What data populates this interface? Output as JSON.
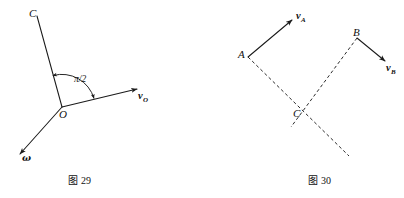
{
  "page": {
    "width": 404,
    "height": 198,
    "background": "#ffffff",
    "ink_color": "#111111"
  },
  "figures": [
    {
      "id": "figure-29",
      "caption_prefix": "图",
      "caption_number": "29",
      "caption_full": "图 29",
      "description": "Rod OC pivoting at O with velocity vector v_O and angular velocity vector omega, right angle pi/2 marked between OC and v_O",
      "points": [
        {
          "name": "C",
          "label": "C",
          "x": 37,
          "y": 16
        },
        {
          "name": "O",
          "label": "O",
          "x": 62,
          "y": 107
        }
      ],
      "vectors": [
        {
          "name": "v_O",
          "symbol": "v",
          "subscript": "O",
          "from_x": 62,
          "from_y": 107,
          "to_x": 140,
          "to_y": 88
        },
        {
          "name": "omega",
          "symbol": "ω",
          "subscript": "",
          "from_x": 62,
          "from_y": 107,
          "to_x": 17,
          "to_y": 157
        }
      ],
      "segments": [
        {
          "name": "rod-OC",
          "from_x": 62,
          "from_y": 107,
          "to_x": 37,
          "to_y": 16,
          "style": "solid"
        }
      ],
      "angle": {
        "name": "pi-over-2",
        "label": "π/2",
        "value": "π/2",
        "vertex_x": 62,
        "vertex_y": 107
      }
    },
    {
      "id": "figure-30",
      "caption_prefix": "图",
      "caption_number": "30",
      "caption_full": "图 30",
      "description": "Points A and B with velocity vectors v_A and v_B; dashed perpendicular construction lines meeting at instantaneous centre C",
      "points": [
        {
          "name": "A",
          "label": "A",
          "x": 248,
          "y": 57
        },
        {
          "name": "B",
          "label": "B",
          "x": 357,
          "y": 38
        },
        {
          "name": "C",
          "label": "C",
          "x": 305,
          "y": 112
        }
      ],
      "vectors": [
        {
          "name": "v_A",
          "symbol": "v",
          "subscript": "A",
          "from_x": 248,
          "from_y": 57,
          "to_x": 295,
          "to_y": 17
        },
        {
          "name": "v_B",
          "symbol": "v",
          "subscript": "B",
          "from_x": 357,
          "from_y": 38,
          "to_x": 388,
          "to_y": 63
        }
      ],
      "segments": [
        {
          "name": "construction-line-A",
          "from_x": 248,
          "from_y": 57,
          "to_x": 349,
          "to_y": 156,
          "style": "dashed"
        },
        {
          "name": "construction-line-B",
          "from_x": 357,
          "from_y": 38,
          "to_x": 291,
          "to_y": 127,
          "style": "dashed"
        }
      ]
    }
  ],
  "labels": {
    "fig29": {
      "C": "C",
      "O": "O",
      "angle": "π/2",
      "v_O_symbol": "v",
      "v_O_sub": "O",
      "omega": "ω"
    },
    "fig30": {
      "A": "A",
      "B": "B",
      "C": "C",
      "v_A_symbol": "v",
      "v_A_sub": "A",
      "v_B_symbol": "v",
      "v_B_sub": "B"
    },
    "captions": {
      "left_prefix": "图",
      "left_number": "29",
      "right_prefix": "图",
      "right_number": "30"
    }
  }
}
